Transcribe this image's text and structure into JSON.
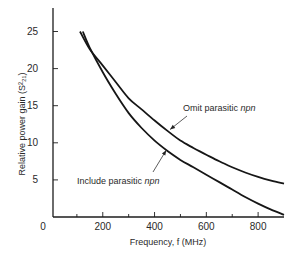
{
  "chart_data": {
    "type": "line",
    "title": "",
    "xlabel": "Frequency, f (MHz)",
    "ylabel": "Relative power gain (S²₂₁)",
    "xlim": [
      0,
      900
    ],
    "ylim": [
      0,
      27
    ],
    "x_ticks": [
      0,
      200,
      400,
      600,
      800
    ],
    "x_minor_ticks": [
      100,
      300,
      500,
      700
    ],
    "y_ticks": [
      5,
      10,
      15,
      20,
      25
    ],
    "grid": false,
    "legend": "none (inline annotations)",
    "series": [
      {
        "name": "Omit parasitic npn",
        "label_plain": "Omit parasitic ",
        "label_italic": "npn",
        "x": [
          112,
          150,
          200,
          250,
          300,
          350,
          400,
          450,
          500,
          550,
          600,
          650,
          700,
          750,
          800,
          850,
          900
        ],
        "values": [
          25.0,
          22.6,
          20.4,
          18.2,
          16.0,
          14.5,
          13.0,
          11.6,
          10.3,
          9.3,
          8.4,
          7.5,
          6.7,
          6.0,
          5.4,
          4.9,
          4.5
        ]
      },
      {
        "name": "Include parasitic npn",
        "label_plain": "Include parasitic ",
        "label_italic": "npn",
        "x": [
          123,
          150,
          200,
          250,
          300,
          350,
          400,
          450,
          500,
          550,
          600,
          650,
          700,
          750,
          800,
          850,
          900
        ],
        "values": [
          25.0,
          22.8,
          19.5,
          16.6,
          14.0,
          12.0,
          10.3,
          8.9,
          7.7,
          6.7,
          5.7,
          4.7,
          3.7,
          2.7,
          1.8,
          1.0,
          0.3
        ]
      }
    ],
    "annotations": [
      {
        "series": "Omit parasitic npn",
        "text_plain": "Omit parasitic ",
        "text_italic": "npn",
        "points_to": {
          "x": 460,
          "y": 11.8
        }
      },
      {
        "series": "Include parasitic npn",
        "text_plain": "Include parasitic ",
        "text_italic": "npn",
        "points_to": {
          "x": 445,
          "y": 9.0
        }
      }
    ]
  }
}
